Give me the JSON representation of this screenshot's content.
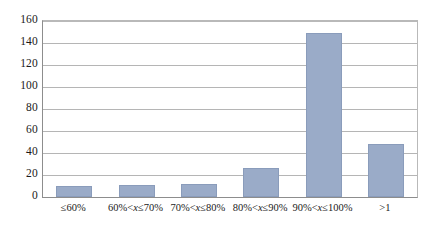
{
  "chart_data": {
    "type": "bar",
    "title": "",
    "subtitle": "",
    "xlabel": "",
    "ylabel": "",
    "categories": [
      "≤60%",
      "60%<x≤70%",
      "70%<x≤80%",
      "80%<x≤90%",
      "90%<x≤100%",
      ">1"
    ],
    "values": [
      10,
      11,
      12,
      26,
      149,
      48
    ],
    "ylim": [
      0,
      160
    ],
    "yticks": [
      0,
      20,
      40,
      60,
      80,
      100,
      120,
      140,
      160
    ],
    "ytick_labels": [
      "0",
      "20",
      "40",
      "60",
      "80",
      "100",
      "120",
      "140",
      "160"
    ],
    "grid": true,
    "legend": false,
    "legend_position": "none",
    "bar_color": "#9aabc8",
    "bar_border_color": "#8a9cbb",
    "gridline_color": "#b5b5b5",
    "axis_color": "#8d8d8d",
    "background_color": "#ffffff"
  }
}
